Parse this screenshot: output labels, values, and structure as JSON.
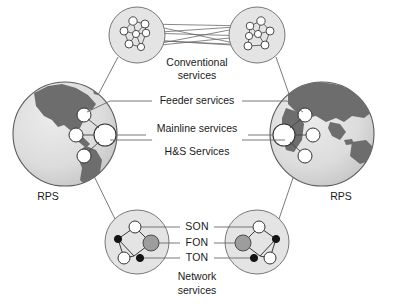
{
  "diagram": {
    "background_color": "#ffffff",
    "line_color": "#555555",
    "text_color": "#1a1a1a",
    "globe_land_color": "#6b6b6b",
    "globe_ocean_color": "#d8d8d8",
    "cluster_fill_color": "#e2e2e2",
    "node_white_color": "#ffffff",
    "node_black_color": "#111111",
    "node_gray_color": "#9a9a9a",
    "labels": {
      "conventional_line1": "Conventional",
      "conventional_line2": "services",
      "feeder": "Feeder services",
      "mainline": "Mainline services",
      "hs": "H&S Services",
      "network_line1": "Network",
      "network_line2": "services",
      "son": "SON",
      "fon": "FON",
      "ton": "TON",
      "rps_left": "RPS",
      "rps_right": "RPS"
    },
    "legend_terms": [
      {
        "abbr": "SON",
        "label": "SON"
      },
      {
        "abbr": "FON",
        "label": "FON"
      },
      {
        "abbr": "TON",
        "label": "TON"
      }
    ],
    "regions": [
      {
        "name": "conventional-services-cluster-left",
        "cx": 137,
        "cy": 35,
        "r": 28
      },
      {
        "name": "conventional-services-cluster-right",
        "cx": 257,
        "cy": 35,
        "r": 28
      },
      {
        "name": "globe-left",
        "cx": 65,
        "cy": 134,
        "r": 52
      },
      {
        "name": "globe-right",
        "cx": 322,
        "cy": 134,
        "r": 52
      },
      {
        "name": "network-services-cluster-left",
        "cx": 137,
        "cy": 242,
        "r": 32
      },
      {
        "name": "network-services-cluster-right",
        "cx": 257,
        "cy": 242,
        "r": 32
      }
    ]
  }
}
